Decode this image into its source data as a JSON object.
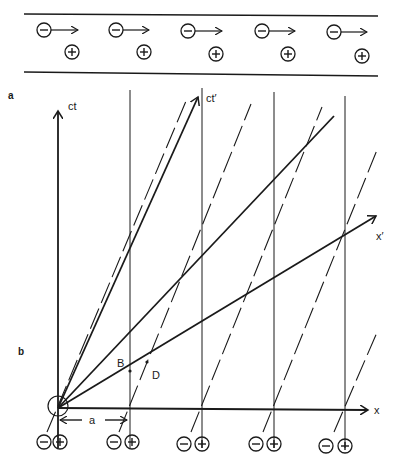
{
  "panel_a": {
    "label": "a",
    "negative_charge_symbol": "−",
    "positive_charge_symbol": "+",
    "negatives": [
      {
        "x": 44,
        "y": 30
      },
      {
        "x": 116,
        "y": 30
      },
      {
        "x": 188,
        "y": 31
      },
      {
        "x": 262,
        "y": 31
      },
      {
        "x": 334,
        "y": 32
      }
    ],
    "positives": [
      {
        "x": 72,
        "y": 52
      },
      {
        "x": 144,
        "y": 52
      },
      {
        "x": 216,
        "y": 54
      },
      {
        "x": 288,
        "y": 54
      },
      {
        "x": 362,
        "y": 56
      }
    ]
  },
  "panel_b": {
    "label": "b",
    "axes": {
      "ct": "ct",
      "x": "x",
      "ct_prime": "ct′",
      "x_prime": "x′"
    },
    "points": {
      "B": "B",
      "D": "D"
    },
    "spacing_label": "a",
    "worldline_positions_x": [
      58,
      130,
      202,
      274,
      345
    ],
    "bottom_pairs": [
      {
        "neg_x": 44,
        "pos_x": 60
      },
      {
        "neg_x": 114,
        "pos_x": 132
      },
      {
        "neg_x": 184,
        "pos_x": 202
      },
      {
        "neg_x": 256,
        "pos_x": 274
      },
      {
        "neg_x": 326,
        "pos_x": 345
      }
    ]
  },
  "colors": {
    "ink": "#1a1a1a",
    "background": "#ffffff"
  }
}
